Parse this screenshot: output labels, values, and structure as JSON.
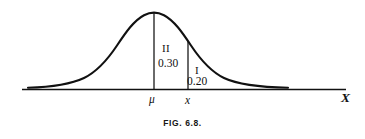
{
  "figure": {
    "caption": "FIG. 6.8.",
    "axis": {
      "name": "X",
      "ticks": [
        {
          "id": "mu",
          "label": "μ",
          "x": 154
        },
        {
          "id": "x",
          "label": "x",
          "x": 188
        }
      ],
      "baseline_y": 89,
      "x_start": 22,
      "x_end": 346
    },
    "curve": {
      "type": "normal-density",
      "mean_px": 154,
      "peak_y": 13,
      "left_end": 28,
      "right_end": 288,
      "stroke": "#111111",
      "stroke_width": 2.1
    },
    "regions": [
      {
        "id": "region-II",
        "roman": "II",
        "value": "0.30",
        "description": "area between mu and x"
      },
      {
        "id": "region-I",
        "roman": "I",
        "value": "0.20",
        "description": "right tail area beyond x"
      }
    ],
    "colors": {
      "ink": "#111111",
      "background": "#ffffff",
      "caption": "#161616"
    }
  }
}
